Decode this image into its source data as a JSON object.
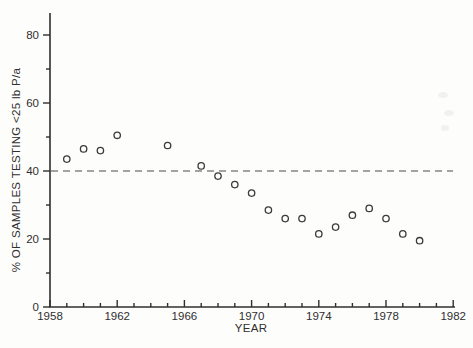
{
  "figure": {
    "background": "#fdfdfc",
    "ink_color": "#2f2f2f",
    "marker_color": "#3a3a3a"
  },
  "chart_data": {
    "type": "scatter",
    "title": "",
    "xlabel": "YEAR",
    "ylabel": "% OF SAMPLES TESTING <25 lb P/a",
    "xlim": [
      1958,
      1982
    ],
    "ylim": [
      0,
      86
    ],
    "x_major_ticks": [
      1958,
      1962,
      1966,
      1970,
      1974,
      1978,
      1982
    ],
    "x_minor_tick_step_years": 1,
    "y_major_ticks": [
      0,
      20,
      40,
      60,
      80
    ],
    "y_minor_tick_step": 10,
    "grid": false,
    "legend": null,
    "reference_line": {
      "y": 40,
      "style": "dashed"
    },
    "marker": {
      "shape": "open-circle",
      "radius": 3.2
    },
    "points": [
      {
        "year": 1959,
        "value": 43.5
      },
      {
        "year": 1960,
        "value": 46.5
      },
      {
        "year": 1961,
        "value": 46
      },
      {
        "year": 1962,
        "value": 50.5
      },
      {
        "year": 1965,
        "value": 47.5
      },
      {
        "year": 1967,
        "value": 41.5
      },
      {
        "year": 1968,
        "value": 38.5
      },
      {
        "year": 1969,
        "value": 36
      },
      {
        "year": 1970,
        "value": 33.5
      },
      {
        "year": 1971,
        "value": 28.5
      },
      {
        "year": 1972,
        "value": 26
      },
      {
        "year": 1973,
        "value": 26
      },
      {
        "year": 1974,
        "value": 21.5
      },
      {
        "year": 1975,
        "value": 23.5
      },
      {
        "year": 1976,
        "value": 27
      },
      {
        "year": 1977,
        "value": 29
      },
      {
        "year": 1978,
        "value": 26
      },
      {
        "year": 1979,
        "value": 21.5
      },
      {
        "year": 1980,
        "value": 19.5
      }
    ]
  }
}
